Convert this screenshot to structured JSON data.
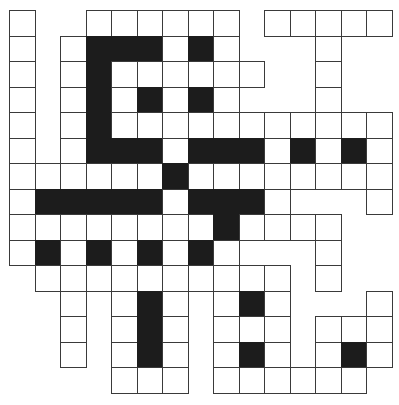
{
  "puzzle": {
    "type": "crossword",
    "rows": 15,
    "cols": 15,
    "cell_size_px": 25.5,
    "legend": {
      "W": "white-cell",
      "B": "black-cell",
      ".": "empty"
    },
    "colors": {
      "white": "#ffffff",
      "black": "#1c1c1c",
      "border": "#3a3a3a"
    },
    "grid": [
      "W..WWWWWW.WWWWW",
      "W.WBBBWBW...W..",
      "W.WBWWWWWW..W..",
      "W.WBWBWBW...W..",
      "W.WBWWWWWWWWWWW",
      "W.WBBBWBBBWBWBW",
      "WWWWWWBWWWWWWWW",
      "WBBBBBWBBBW...W",
      "WWWWWWWWBWWWW..",
      "WBWBWBWBW...W..",
      ".WWWWWWWWWW.W..",
      "..W.WBW.WBW...W",
      "..W.WBW.WWW.WWW",
      "..W.WBW.WBW.WBW",
      "....WWW.WWWWWW."
    ]
  }
}
